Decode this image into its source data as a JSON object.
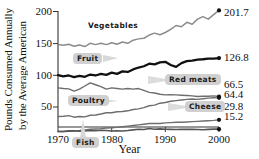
{
  "chart_data": {
    "type": "line",
    "title": "",
    "xlabel": "Year",
    "ylabel": "Pounds Consumed Annually by the Average American",
    "ylabel_line1": "Pounds Consumed Annually",
    "ylabel_line2": "by the Average American",
    "xlim": [
      1970,
      2000
    ],
    "ylim": [
      0,
      210
    ],
    "grid": false,
    "legend_position": "inline-callouts",
    "xticks": [
      1970,
      1980,
      1990,
      2000
    ],
    "xtick_labels": [
      "1970",
      "1980",
      "1990",
      "2000"
    ],
    "yticks": [
      50,
      100,
      150,
      200
    ],
    "ytick_labels": [
      "50",
      "100",
      "150",
      "200"
    ],
    "x": [
      1970,
      1971,
      1972,
      1973,
      1974,
      1975,
      1976,
      1977,
      1978,
      1979,
      1980,
      1981,
      1982,
      1983,
      1984,
      1985,
      1986,
      1987,
      1988,
      1989,
      1990,
      1991,
      1992,
      1993,
      1994,
      1995,
      1996,
      1997,
      1998,
      1999,
      2000
    ],
    "series": [
      {
        "name": "Vegetables",
        "label": "Vegetables",
        "color": "#8c8c8c",
        "end_value": 201.7,
        "end_value_label": "201.7",
        "values": [
          148.0,
          147.0,
          148.5,
          145.5,
          147.5,
          145.0,
          150.0,
          148.0,
          150.0,
          148.0,
          151.0,
          148.5,
          152.0,
          150.0,
          155.0,
          157.0,
          158.0,
          163.0,
          166.0,
          163.5,
          167.0,
          172.0,
          178.0,
          176.0,
          183.0,
          180.0,
          188.0,
          192.0,
          188.0,
          195.0,
          201.7
        ]
      },
      {
        "name": "Fruit",
        "label": "Fruit",
        "color": "#111111",
        "end_value": 126.8,
        "end_value_label": "126.8",
        "values": [
          100.0,
          98.0,
          99.5,
          97.0,
          99.0,
          97.5,
          101.0,
          99.5,
          102.0,
          100.5,
          104.0,
          102.0,
          106.0,
          105.0,
          109.0,
          112.0,
          114.0,
          118.0,
          117.0,
          120.0,
          121.0,
          116.0,
          113.0,
          119.0,
          122.0,
          123.0,
          124.5,
          125.0,
          126.0,
          126.0,
          126.8
        ]
      },
      {
        "name": "Red meats",
        "label": "Red meats",
        "color": "#6e6e6e",
        "end_value": 66.5,
        "end_value_label": "66.5",
        "values": [
          80.0,
          79.0,
          78.5,
          75.0,
          78.0,
          83.0,
          88.0,
          85.0,
          82.0,
          78.0,
          80.0,
          79.0,
          78.0,
          79.0,
          78.0,
          79.0,
          76.0,
          73.0,
          72.0,
          70.0,
          69.0,
          69.5,
          69.0,
          68.5,
          68.0,
          67.5,
          66.5,
          67.0,
          67.0,
          67.5,
          66.5
        ]
      },
      {
        "name": "Poultry",
        "label": "Poultry",
        "color": "#6e6e6e",
        "end_value": 64.4,
        "end_value_label": "64.4",
        "values": [
          35.0,
          35.5,
          36.5,
          34.0,
          35.0,
          34.5,
          37.0,
          37.5,
          39.0,
          41.0,
          41.0,
          42.5,
          43.0,
          44.0,
          46.0,
          47.0,
          49.0,
          52.0,
          53.0,
          56.0,
          57.0,
          59.0,
          60.0,
          61.0,
          62.0,
          62.5,
          62.0,
          63.0,
          64.0,
          64.5,
          64.4
        ]
      },
      {
        "name": "Cheese",
        "label": "Cheese",
        "color": "#6e6e6e",
        "end_value": 29.8,
        "end_value_label": "29.8",
        "values": [
          11.0,
          11.5,
          12.0,
          12.5,
          13.0,
          14.0,
          15.0,
          15.5,
          16.0,
          17.0,
          17.5,
          18.0,
          19.0,
          20.0,
          21.0,
          22.0,
          23.0,
          24.0,
          24.0,
          24.0,
          25.0,
          25.5,
          26.0,
          26.0,
          26.5,
          27.0,
          27.5,
          28.0,
          28.5,
          29.0,
          29.8
        ]
      },
      {
        "name": "Fish",
        "label": "Fish",
        "color": "#555555",
        "end_value": 15.2,
        "end_value_label": "15.2",
        "values": [
          11.8,
          11.5,
          12.5,
          12.8,
          12.0,
          12.2,
          13.0,
          12.6,
          13.4,
          13.0,
          12.4,
          12.6,
          12.4,
          13.0,
          14.1,
          15.0,
          14.7,
          16.1,
          15.1,
          15.6,
          15.0,
          14.8,
          14.7,
          14.9,
          15.1,
          14.9,
          14.7,
          14.3,
          14.8,
          15.2,
          15.2
        ]
      }
    ]
  },
  "axis": {
    "ytick_200": "200",
    "ytick_150": "150",
    "ytick_100": "100",
    "ytick_50": "50",
    "xtick_1970": "1970",
    "xtick_1980": "1980",
    "xtick_1990": "1990",
    "xtick_2000": "2000",
    "xaxis_title": "Year",
    "yaxis_title_line1": "Pounds Consumed Annually",
    "yaxis_title_line2": "by the Average American"
  },
  "labels": {
    "vegetables": "Vegetables",
    "fruit": "Fruit",
    "red_meats": "Red meats",
    "poultry": "Poultry",
    "cheese": "Cheese",
    "fish": "Fish"
  },
  "end_values": {
    "vegetables": "201.7",
    "fruit": "126.8",
    "red_meats": "66.5",
    "poultry": "64.4",
    "cheese": "29.8",
    "fish": "15.2"
  },
  "colors": {
    "vegetables_line": "#8c8c8c",
    "fruit_line": "#111111",
    "red_meats_line": "#6e6e6e",
    "poultry_line": "#6e6e6e",
    "cheese_line": "#6e6e6e",
    "fish_line": "#555555",
    "axis": "#333333",
    "callout_bg": "#d0d0d0",
    "background": "#ffffff"
  }
}
